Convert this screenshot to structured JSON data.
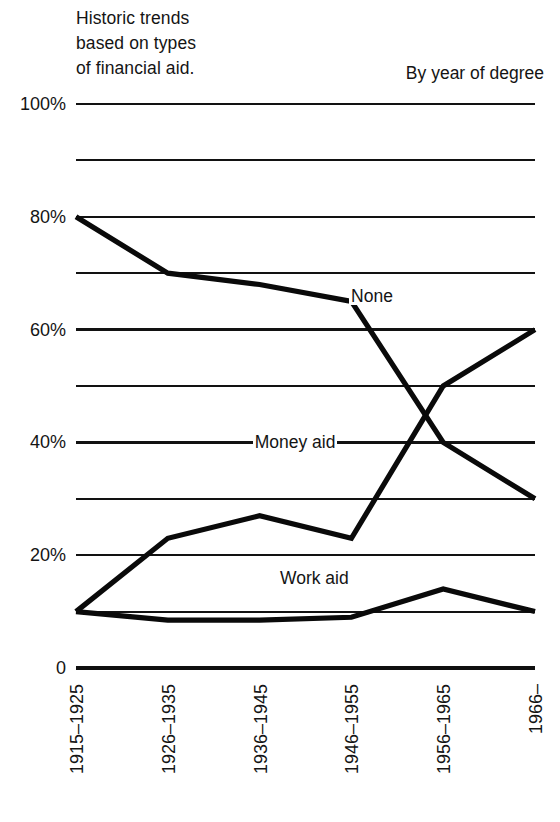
{
  "header": {
    "title_lines": [
      "Historic trends",
      "based on types",
      "of financial aid."
    ],
    "subtitle": "By year of degree"
  },
  "chart_data": {
    "type": "line",
    "title": "Historic trends based on types of financial aid.",
    "subtitle": "By year of degree",
    "xlabel": "",
    "ylabel": "",
    "categories": [
      "1915–1925",
      "1926–1935",
      "1936–1945",
      "1946–1955",
      "1956–1965",
      "1966–"
    ],
    "ylim": [
      0,
      100
    ],
    "yticks": [
      0,
      10,
      20,
      30,
      40,
      50,
      60,
      70,
      80,
      90,
      100
    ],
    "ytick_labels": [
      "0",
      "",
      "20%",
      "",
      "40%",
      "",
      "60%",
      "",
      "80%",
      "",
      "100%"
    ],
    "grid": true,
    "grid_axis": "y",
    "legend": "inline-labels",
    "series": [
      {
        "name": "None",
        "values": [
          80,
          70,
          68,
          65,
          40,
          30
        ],
        "label_x_pct": 0.595,
        "label_y_value": 66
      },
      {
        "name": "Money aid",
        "values": [
          10,
          23,
          27,
          23,
          50,
          60
        ],
        "label_x_pct": 0.385,
        "label_y_value": 40
      },
      {
        "name": "Work aid",
        "values": [
          10,
          8.5,
          8.5,
          9,
          14,
          10
        ],
        "label_x_pct": 0.44,
        "label_y_value": 16
      }
    ]
  },
  "axis": {
    "ytick_labels": [
      "100%",
      "80%",
      "60%",
      "40%",
      "20%",
      "0"
    ],
    "xtick_labels": [
      "1915–1925",
      "1926–1935",
      "1936–1945",
      "1946–1955",
      "1956–1965",
      "1966–"
    ]
  },
  "colors": {
    "ink": "#0a0a0a",
    "background": "#ffffff"
  }
}
